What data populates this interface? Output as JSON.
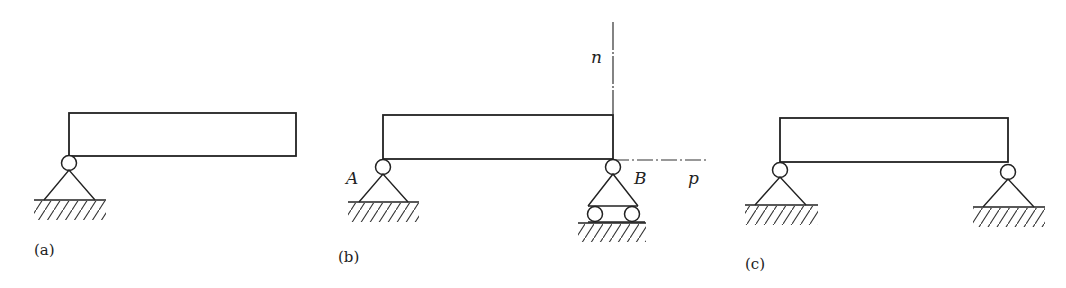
{
  "figure": {
    "panels": [
      {
        "id": "a",
        "caption": "(a)",
        "description": "Beam with single pin support at left end"
      },
      {
        "id": "b",
        "caption": "(b)",
        "description": "Simply supported beam: pin at A, roller at B, with n and p axes at B",
        "labels": {
          "support_left": "A",
          "support_right": "B",
          "normal_axis": "n",
          "tangent_axis": "p"
        }
      },
      {
        "id": "c",
        "caption": "(c)",
        "description": "Beam with pin supports at both ends"
      }
    ],
    "colors": {
      "stroke": "#222222",
      "background": "#ffffff"
    }
  }
}
